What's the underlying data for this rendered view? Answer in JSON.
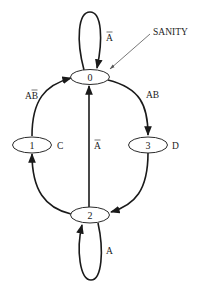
{
  "diagram": {
    "nodes": [
      {
        "id": "0",
        "label": "0",
        "output": ""
      },
      {
        "id": "1",
        "label": "1",
        "output": "C"
      },
      {
        "id": "2",
        "label": "2",
        "output": ""
      },
      {
        "id": "3",
        "label": "3",
        "output": "D"
      }
    ],
    "edges": [
      {
        "from": "0",
        "to": "0",
        "condition": "A",
        "overline": "A"
      },
      {
        "from": "0",
        "to": "3",
        "condition": "AB",
        "overline": ""
      },
      {
        "from": "3",
        "to": "2",
        "condition": "",
        "overline": ""
      },
      {
        "from": "2",
        "to": "1",
        "condition": "",
        "overline": ""
      },
      {
        "from": "1",
        "to": "0",
        "condition": "AB",
        "overline": "B"
      },
      {
        "from": "2",
        "to": "0",
        "condition": "A",
        "overline": "A"
      },
      {
        "from": "2",
        "to": "2",
        "condition": "A",
        "overline": ""
      }
    ],
    "annotation": {
      "text": "SANITY",
      "points_to": "0"
    },
    "colors": {
      "stroke": "#1a1a1a",
      "pointer": "#555555",
      "background": "#ffffff"
    }
  }
}
